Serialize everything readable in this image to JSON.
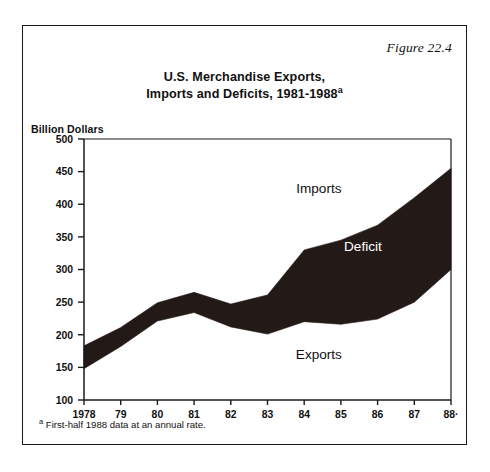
{
  "figure": {
    "number_label": "Figure 22.4",
    "title_line1": "U.S. Merchandise Exports,",
    "title_line2": "Imports and Deficits, 1981-1988",
    "title_superscript": "a",
    "y_axis_caption": "Billion Dollars",
    "footnote_marker": "a",
    "footnote_text": " First-half 1988 data at an annual rate."
  },
  "colors": {
    "band_fill": "#231a17",
    "frame": "#1a1a1a",
    "axis": "#1a1a1a",
    "text": "#111111",
    "background": "#ffffff",
    "label_on_band": "#ffffff"
  },
  "chart_data": {
    "type": "area",
    "title": "U.S. Merchandise Exports, Imports and Deficits, 1981-1988",
    "xlabel": "",
    "ylabel": "Billion Dollars",
    "ylim": [
      100,
      500
    ],
    "yticks": [
      100,
      150,
      200,
      250,
      300,
      350,
      400,
      450,
      500
    ],
    "ytick_labels": [
      "100",
      "150",
      "200",
      "250",
      "300",
      "350",
      "400",
      "450",
      "500"
    ],
    "grid": false,
    "legend_position": "inline-annotations",
    "x": [
      1978,
      1979,
      1980,
      1981,
      1982,
      1983,
      1984,
      1985,
      1986,
      1987,
      1988
    ],
    "xtick_labels": [
      "1978",
      "79",
      "80",
      "81",
      "82",
      "83",
      "84",
      "85",
      "86",
      "87",
      "88·"
    ],
    "series": [
      {
        "name": "Imports",
        "values": [
          183,
          211,
          249,
          265,
          247,
          261,
          330,
          345,
          368,
          410,
          455
        ]
      },
      {
        "name": "Exports",
        "values": [
          148,
          182,
          221,
          234,
          212,
          201,
          220,
          216,
          224,
          250,
          300
        ]
      }
    ],
    "shaded_band": {
      "name": "Deficit",
      "upper_series": "Imports",
      "lower_series": "Exports",
      "values": [
        35,
        29,
        28,
        31,
        35,
        60,
        110,
        129,
        144,
        160,
        155
      ]
    },
    "annotations": [
      {
        "text": "Imports",
        "x": 1984.4,
        "y": 418,
        "style": "dark"
      },
      {
        "text": "Deficit",
        "x": 1985.6,
        "y": 328,
        "style": "light"
      },
      {
        "text": "Exports",
        "x": 1984.4,
        "y": 163,
        "style": "dark"
      }
    ]
  }
}
